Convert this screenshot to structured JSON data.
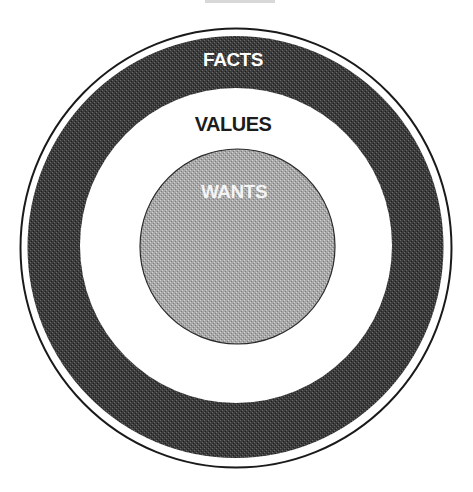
{
  "diagram": {
    "title_cropped": "THE MODEL",
    "layers": [
      {
        "id": "outer",
        "label": "FACTS",
        "fill": "#3a3a3a",
        "label_color": "#ffffff"
      },
      {
        "id": "middle",
        "label": "VALUES",
        "fill": "#ffffff",
        "label_color": "#1c1c1c"
      },
      {
        "id": "inner",
        "label": "WANTS",
        "fill": "#a9a9a9",
        "label_color": "#f4f4f4"
      }
    ],
    "outline_color": "#1a1a1a"
  }
}
